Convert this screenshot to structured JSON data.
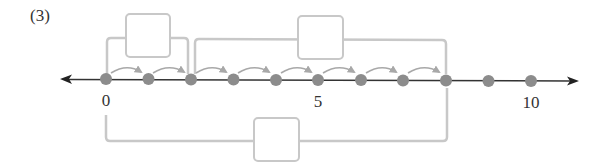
{
  "problem": {
    "label": "(3)"
  },
  "number_line": {
    "min": 0,
    "max": 10,
    "labeled_ticks": [
      {
        "value": 0,
        "label": "0"
      },
      {
        "value": 5,
        "label": "5"
      },
      {
        "value": 10,
        "label": "10"
      }
    ],
    "dots": [
      0,
      1,
      2,
      3,
      4,
      5,
      6,
      7,
      8,
      9,
      10
    ],
    "hop_arrows": [
      [
        0,
        1
      ],
      [
        1,
        2
      ],
      [
        2,
        3
      ],
      [
        3,
        4
      ],
      [
        4,
        5
      ],
      [
        5,
        6
      ],
      [
        6,
        7
      ]
    ]
  },
  "brackets": [
    {
      "name": "top-bracket-1",
      "from": 0,
      "to": 2,
      "position": "above",
      "answer_box": ""
    },
    {
      "name": "top-bracket-2",
      "from": 2,
      "to": 8,
      "position": "above",
      "answer_box": ""
    },
    {
      "name": "bottom-bracket",
      "from": 0,
      "to": 8,
      "position": "below",
      "answer_box": ""
    }
  ],
  "colors": {
    "line": "#333333",
    "dot": "#8c8c8c",
    "bracket": "#c8c8c8",
    "arrow": "#a8a8a8",
    "box_border": "#c8c8c8"
  }
}
